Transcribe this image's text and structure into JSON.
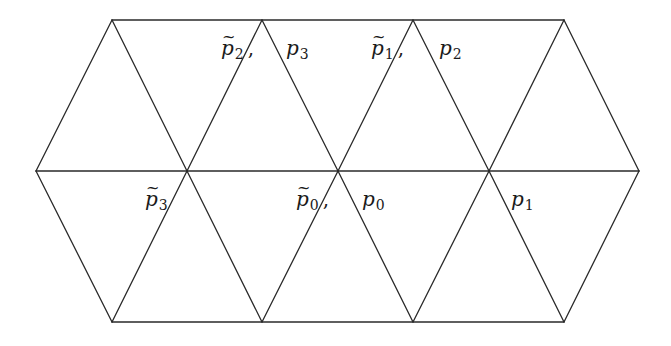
{
  "diagram": {
    "type": "triangulated-hexagon",
    "stroke_color": "#2a2a2a",
    "background": "#ffffff",
    "vertices": {
      "top": [
        [
          112,
          20
        ],
        [
          262,
          20
        ],
        [
          413,
          20
        ],
        [
          564,
          20
        ]
      ],
      "middle": [
        [
          36,
          171
        ],
        [
          187,
          171
        ],
        [
          338,
          171
        ],
        [
          489,
          171
        ],
        [
          639,
          171
        ]
      ],
      "bottom": [
        [
          112,
          322
        ],
        [
          262,
          322
        ],
        [
          413,
          322
        ],
        [
          564,
          322
        ]
      ]
    },
    "labels": [
      {
        "id": "p2_tilde",
        "symbol": "p",
        "sub": "2",
        "tilde": true,
        "comma": true,
        "x": 220,
        "y": 36
      },
      {
        "id": "p3",
        "symbol": "p",
        "sub": "3",
        "tilde": false,
        "comma": false,
        "x": 286,
        "y": 36
      },
      {
        "id": "p1_tilde",
        "symbol": "p",
        "sub": "1",
        "tilde": true,
        "comma": true,
        "x": 370,
        "y": 36
      },
      {
        "id": "p2",
        "symbol": "p",
        "sub": "2",
        "tilde": false,
        "comma": false,
        "x": 439,
        "y": 36
      },
      {
        "id": "p3_tilde",
        "symbol": "p",
        "sub": "3",
        "tilde": true,
        "comma": false,
        "x": 145,
        "y": 187
      },
      {
        "id": "p0_tilde",
        "symbol": "p",
        "sub": "0",
        "tilde": true,
        "comma": true,
        "x": 295,
        "y": 187
      },
      {
        "id": "p0",
        "symbol": "p",
        "sub": "0",
        "tilde": false,
        "comma": false,
        "x": 362,
        "y": 187
      },
      {
        "id": "p1",
        "symbol": "p",
        "sub": "1",
        "tilde": false,
        "comma": false,
        "x": 511,
        "y": 187
      }
    ]
  },
  "text": {
    "l0_sym": "p",
    "l0_sub": "2",
    "l0_tilde": "~",
    "l0_comma": ",",
    "l1_sym": "p",
    "l1_sub": "3",
    "l2_sym": "p",
    "l2_sub": "1",
    "l2_tilde": "~",
    "l2_comma": ",",
    "l3_sym": "p",
    "l3_sub": "2",
    "l4_sym": "p",
    "l4_sub": "3",
    "l4_tilde": "~",
    "l5_sym": "p",
    "l5_sub": "0",
    "l5_tilde": "~",
    "l5_comma": ",",
    "l6_sym": "p",
    "l6_sub": "0",
    "l7_sym": "p",
    "l7_sub": "1"
  }
}
